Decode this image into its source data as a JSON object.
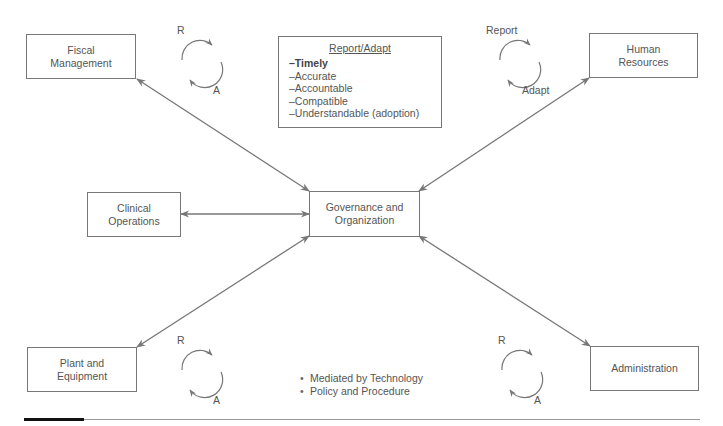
{
  "diagram": {
    "center": {
      "label_line1": "Governance and",
      "label_line2": "Organization"
    },
    "nodes": {
      "fiscal": {
        "label_line1": "Fiscal",
        "label_line2": "Management"
      },
      "hr": {
        "label_line1": "Human",
        "label_line2": "Resources"
      },
      "clinical": {
        "label_line1": "Clinical",
        "label_line2": "Operations"
      },
      "plant": {
        "label_line1": "Plant and",
        "label_line2": "Equipment"
      },
      "admin": {
        "label_line1": "Administration"
      }
    },
    "cycles": [
      {
        "top": "R",
        "bottom": "A"
      },
      {
        "top": "Report",
        "bottom": "Adapt"
      },
      {
        "top": "R",
        "bottom": "A"
      },
      {
        "top": "R",
        "bottom": "A"
      }
    ],
    "report_adapt": {
      "title": "Report/Adapt",
      "items": [
        "–Timely",
        "–Accurate",
        "–Accountable",
        "–Compatible",
        "–Understandable (adoption)"
      ]
    },
    "notes": [
      "Mediated by Technology",
      "Policy and Procedure"
    ],
    "colors": {
      "line": "#777777",
      "text": "#555555",
      "rule_accent": "#111111"
    }
  }
}
